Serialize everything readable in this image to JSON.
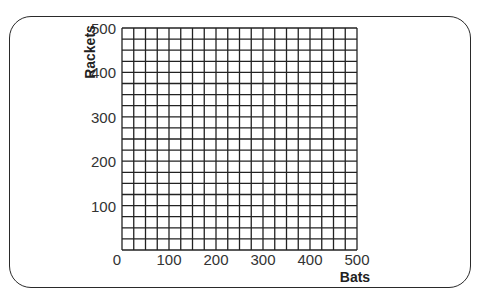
{
  "chart_data": {
    "type": "scatter",
    "title": "",
    "xlabel": "Bats",
    "ylabel": "Rackets",
    "xlim": [
      0,
      500
    ],
    "ylim": [
      0,
      500
    ],
    "x_ticks": [
      "0",
      "100",
      "200",
      "300",
      "400",
      "500"
    ],
    "y_ticks": [
      "100",
      "200",
      "300",
      "400",
      "500"
    ],
    "grid": true,
    "grid_step": 25,
    "series": [],
    "note": "Blank grid for plotting; no data points shown"
  },
  "labels": {
    "x_axis_title": "Bats",
    "y_axis_title": "Rackets",
    "x0": "0",
    "x100": "100",
    "x200": "200",
    "x300": "300",
    "x400": "400",
    "x500": "500",
    "y100": "100",
    "y200": "200",
    "y300": "300",
    "y400": "400",
    "y500": "500"
  },
  "colors": {
    "grid": "#222222",
    "frame": "#2a2a2a",
    "text": "#333333"
  }
}
